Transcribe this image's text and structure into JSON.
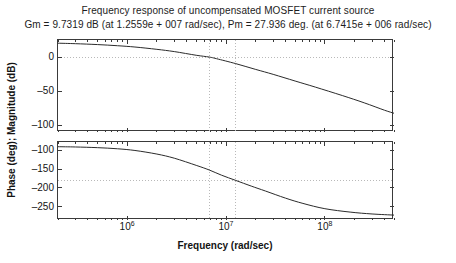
{
  "figure": {
    "title": "Frequency response of uncompensated MOSFET current source",
    "subtitle": "Gm = 9.7319 dB (at 1.2559e + 007 rad/sec), Pm = 27.936 deg. (at 6.7415e + 006 rad/sec)",
    "ylabel_shared": "Phase (deg); Magnitude (dB)",
    "xlabel": "Frequency (rad/sec)"
  },
  "margins": {
    "gain_margin_db": 9.7319,
    "gain_margin_label": "Gm = 9.7319 dB",
    "gain_crossover_freq": "1.2559e + 007 rad/sec",
    "phase_margin_deg": 27.936,
    "phase_margin_label": "Pm = 27.936 deg.",
    "phase_crossover_freq": "6.7415e + 006 rad/sec"
  },
  "chart_data": [
    {
      "type": "line",
      "id": "magnitude",
      "title": "Magnitude response",
      "xlabel": "Frequency (rad/sec)",
      "ylabel": "Magnitude (dB)",
      "xscale": "log",
      "xlim": [
        200000,
        500000000
      ],
      "ylim": [
        -110,
        25
      ],
      "yticks": [
        0,
        -50,
        -100
      ],
      "ytick_labels": [
        "0",
        "-50",
        "-100"
      ],
      "xticks": [
        1000000,
        10000000,
        100000000
      ],
      "xtick_labels": [
        "10^6",
        "10^7",
        "10^8"
      ],
      "grid": false,
      "reference_lines": [
        {
          "orientation": "horizontal",
          "value": 0,
          "style": "dotted"
        },
        {
          "orientation": "vertical",
          "value": 6741500,
          "style": "dotted"
        },
        {
          "orientation": "vertical",
          "value": 12559000,
          "style": "dotted"
        }
      ],
      "series": [
        {
          "name": "Open-loop magnitude",
          "x": [
            200000,
            300000,
            500000,
            800000,
            1200000,
            2000000,
            3000000,
            5000000,
            6741500,
            8000000,
            12559000,
            20000000,
            30000000,
            50000000,
            80000000,
            150000000,
            250000000,
            400000000,
            500000000
          ],
          "y": [
            20.3,
            19.6,
            18.3,
            16.6,
            14.7,
            11.3,
            8.0,
            2.6,
            0.0,
            -2.4,
            -9.7,
            -18.2,
            -25.4,
            -35.2,
            -44.1,
            -56.5,
            -67.2,
            -78.0,
            -82.5
          ]
        }
      ]
    },
    {
      "type": "line",
      "id": "phase",
      "title": "Phase response",
      "xlabel": "Frequency (rad/sec)",
      "ylabel": "Phase (deg)",
      "xscale": "log",
      "xlim": [
        200000,
        500000000
      ],
      "ylim": [
        -285,
        -78
      ],
      "yticks": [
        -100,
        -150,
        -200,
        -250
      ],
      "ytick_labels": [
        "-100",
        "-150",
        "-200",
        "-250"
      ],
      "xticks": [
        1000000,
        10000000,
        100000000
      ],
      "xtick_labels": [
        "10^6",
        "10^7",
        "10^8"
      ],
      "grid": false,
      "reference_lines": [
        {
          "orientation": "horizontal",
          "value": -180,
          "style": "dotted"
        },
        {
          "orientation": "vertical",
          "value": 6741500,
          "style": "dotted"
        },
        {
          "orientation": "vertical",
          "value": 12559000,
          "style": "dotted"
        }
      ],
      "series": [
        {
          "name": "Open-loop phase",
          "x": [
            200000,
            300000,
            500000,
            800000,
            1200000,
            2000000,
            3000000,
            5000000,
            6741500,
            9000000,
            12559000,
            18000000,
            25000000,
            40000000,
            60000000,
            100000000,
            180000000,
            300000000,
            500000000
          ],
          "y": [
            -90.5,
            -91.2,
            -93.0,
            -96.0,
            -100.5,
            -110.0,
            -121.0,
            -140.0,
            -152.1,
            -166.0,
            -180.0,
            -195.0,
            -208.0,
            -227.0,
            -241.0,
            -255.0,
            -264.0,
            -269.0,
            -272.0
          ]
        }
      ]
    }
  ]
}
